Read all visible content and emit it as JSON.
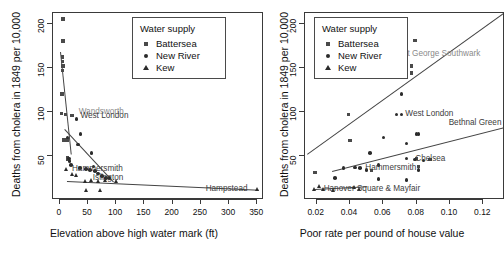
{
  "figure": {
    "background": "#ffffff",
    "point_color": "#2b2b2b",
    "square_color": "#4a4a4a",
    "line_color": "#444444",
    "label_color": "#3d3d3d"
  },
  "legend": {
    "title": "Water supply",
    "items": [
      {
        "label": "Battersea",
        "glyph": "square-marker"
      },
      {
        "label": "New River",
        "glyph": "circle-marker"
      },
      {
        "label": "Kew",
        "glyph": "triangle-marker"
      }
    ]
  },
  "chart_data": [
    {
      "id": "left",
      "type": "scatter",
      "title": "",
      "xlabel": "Elevation above high water mark (ft)",
      "ylabel": "Deaths from cholera in 1849 per 10,000",
      "xlim": [
        -12,
        362
      ],
      "ylim": [
        0,
        212
      ],
      "xticks": [
        0,
        50,
        100,
        150,
        200,
        250,
        300,
        350
      ],
      "yticks": [
        50,
        100,
        150,
        200
      ],
      "grid": false,
      "legend_position": "top-right",
      "series": [
        {
          "name": "Battersea",
          "glyph": "square-marker",
          "points": [
            {
              "x": 6,
              "y": 205
            },
            {
              "x": 6,
              "y": 180
            },
            {
              "x": 5,
              "y": 162
            },
            {
              "x": 5,
              "y": 157
            },
            {
              "x": 6,
              "y": 152
            },
            {
              "x": 5,
              "y": 147
            },
            {
              "x": 4,
              "y": 120
            },
            {
              "x": 3,
              "y": 98
            },
            {
              "x": 10,
              "y": 97
            },
            {
              "x": 22,
              "y": 96
            },
            {
              "x": 8,
              "y": 68
            },
            {
              "x": 13,
              "y": 68
            },
            {
              "x": 14,
              "y": 48
            },
            {
              "x": 15,
              "y": 46
            }
          ]
        },
        {
          "name": "New River",
          "glyph": "circle-marker",
          "points": [
            {
              "x": 14,
              "y": 71
            },
            {
              "x": 30,
              "y": 92
            },
            {
              "x": 37,
              "y": 75
            },
            {
              "x": 32,
              "y": 63
            },
            {
              "x": 56,
              "y": 53
            },
            {
              "x": 16,
              "y": 47
            },
            {
              "x": 17,
              "y": 44
            },
            {
              "x": 20,
              "y": 40
            },
            {
              "x": 46,
              "y": 35
            },
            {
              "x": 54,
              "y": 34
            },
            {
              "x": 62,
              "y": 33
            },
            {
              "x": 68,
              "y": 30
            },
            {
              "x": 75,
              "y": 27
            },
            {
              "x": 82,
              "y": 25
            },
            {
              "x": 88,
              "y": 25
            },
            {
              "x": 36,
              "y": 36
            },
            {
              "x": 60,
              "y": 38
            }
          ]
        },
        {
          "name": "Kew",
          "glyph": "triangle-marker",
          "points": [
            {
              "x": 12,
              "y": 35
            },
            {
              "x": 22,
              "y": 29
            },
            {
              "x": 30,
              "y": 28
            },
            {
              "x": 46,
              "y": 21
            },
            {
              "x": 57,
              "y": 22
            },
            {
              "x": 68,
              "y": 21
            },
            {
              "x": 82,
              "y": 22
            },
            {
              "x": 100,
              "y": 21
            },
            {
              "x": 48,
              "y": 11
            },
            {
              "x": 72,
              "y": 11
            },
            {
              "x": 350,
              "y": 12
            }
          ]
        }
      ],
      "fit_lines": [
        {
          "series": "Battersea",
          "x1": 3,
          "y1": 168,
          "x2": 22,
          "y2": 52
        },
        {
          "series": "New River",
          "x1": 9,
          "y1": 80,
          "x2": 96,
          "y2": 20
        },
        {
          "series": "Kew",
          "x1": 12,
          "y1": 22,
          "x2": 352,
          "y2": 12
        }
      ],
      "annotations": [
        {
          "text": "Wandsworth",
          "x": 30,
          "y": 100,
          "faint": true
        },
        {
          "text": "West London",
          "x": 33,
          "y": 95,
          "faint": false
        },
        {
          "text": "Hammersmith",
          "x": 18,
          "y": 35,
          "faint": false
        },
        {
          "text": "Islington",
          "x": 55,
          "y": 25,
          "faint": false
        },
        {
          "text": "Hampstead",
          "x": 255,
          "y": 13,
          "faint": false
        }
      ]
    },
    {
      "id": "right",
      "type": "scatter",
      "title": "",
      "xlabel": "Poor rate per pound of house value",
      "ylabel": "Deaths from cholera in 1849 per 10,000",
      "xlim": [
        0.013,
        0.133
      ],
      "ylim": [
        0,
        212
      ],
      "xticks": [
        0.02,
        0.04,
        0.06,
        0.08,
        0.1,
        0.12
      ],
      "xticklabels": [
        "0.02",
        "0.04",
        "0.06",
        "0.08",
        "0.10",
        "0.12"
      ],
      "yticks": [
        50,
        100,
        150,
        200
      ],
      "grid": false,
      "legend_position": "top-left",
      "series": [
        {
          "name": "Battersea",
          "glyph": "square-marker",
          "points": [
            {
              "x": 0.079,
              "y": 181
            },
            {
              "x": 0.077,
              "y": 152
            },
            {
              "x": 0.077,
              "y": 144
            },
            {
              "x": 0.039,
              "y": 97
            },
            {
              "x": 0.04,
              "y": 67
            },
            {
              "x": 0.019,
              "y": 31
            },
            {
              "x": 0.053,
              "y": 33
            },
            {
              "x": 0.08,
              "y": 47
            },
            {
              "x": 0.088,
              "y": 46
            },
            {
              "x": 0.081,
              "y": 38
            }
          ]
        },
        {
          "name": "New River",
          "glyph": "circle-marker",
          "points": [
            {
              "x": 0.071,
              "y": 120
            },
            {
              "x": 0.068,
              "y": 97
            },
            {
              "x": 0.071,
              "y": 97
            },
            {
              "x": 0.08,
              "y": 75
            },
            {
              "x": 0.081,
              "y": 75
            },
            {
              "x": 0.06,
              "y": 71
            },
            {
              "x": 0.074,
              "y": 64
            },
            {
              "x": 0.052,
              "y": 53
            },
            {
              "x": 0.074,
              "y": 47
            },
            {
              "x": 0.079,
              "y": 46
            },
            {
              "x": 0.084,
              "y": 45
            },
            {
              "x": 0.057,
              "y": 40
            },
            {
              "x": 0.043,
              "y": 37
            },
            {
              "x": 0.046,
              "y": 36
            },
            {
              "x": 0.036,
              "y": 36
            },
            {
              "x": 0.05,
              "y": 34
            },
            {
              "x": 0.081,
              "y": 34
            },
            {
              "x": 0.031,
              "y": 25
            },
            {
              "x": 0.057,
              "y": 24
            },
            {
              "x": 0.074,
              "y": 23
            }
          ]
        },
        {
          "name": "Kew",
          "glyph": "triangle-marker",
          "points": [
            {
              "x": 0.022,
              "y": 16
            },
            {
              "x": 0.019,
              "y": 12
            },
            {
              "x": 0.024,
              "y": 12
            },
            {
              "x": 0.043,
              "y": 15
            },
            {
              "x": 0.046,
              "y": 12
            },
            {
              "x": 0.03,
              "y": 11
            }
          ]
        }
      ],
      "fit_lines": [
        {
          "series": "Battersea",
          "x1": 0.014,
          "y1": 52,
          "x2": 0.132,
          "y2": 212
        },
        {
          "series": "New River",
          "x1": 0.029,
          "y1": 33,
          "x2": 0.133,
          "y2": 83
        },
        {
          "series": "Kew",
          "x1": 0.019,
          "y1": 12,
          "x2": 0.05,
          "y2": 15
        }
      ],
      "annotations": [
        {
          "text": "St George Southwark",
          "x": 0.07,
          "y": 165,
          "faint": true
        },
        {
          "text": "West London",
          "x": 0.072,
          "y": 97,
          "faint": false
        },
        {
          "text": "Bethnal Green",
          "x": 0.098,
          "y": 87,
          "faint": false
        },
        {
          "text": "Chelsea",
          "x": 0.078,
          "y": 46,
          "faint": false
        },
        {
          "text": "Hammersmith",
          "x": 0.048,
          "y": 36,
          "faint": false
        },
        {
          "text": "Hanover Square & Mayfair",
          "x": 0.023,
          "y": 12,
          "faint": false
        }
      ]
    }
  ]
}
